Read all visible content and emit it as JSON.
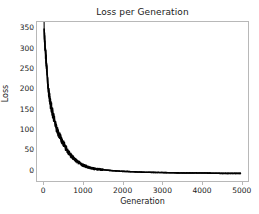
{
  "chart_data": {
    "type": "line",
    "title": "Loss per Generation",
    "xlabel": "Generation",
    "ylabel": "Loss",
    "xlim": [
      -180,
      5180
    ],
    "ylim": [
      -28,
      368
    ],
    "xticks": [
      0,
      1000,
      2000,
      3000,
      4000,
      5000
    ],
    "yticks": [
      0,
      50,
      100,
      150,
      200,
      250,
      300,
      350
    ],
    "grid": false,
    "legend": null,
    "line_color": "#000000",
    "series": [
      {
        "name": "Loss",
        "x": [
          0,
          10,
          20,
          30,
          40,
          50,
          60,
          70,
          80,
          90,
          100,
          120,
          140,
          160,
          180,
          200,
          220,
          240,
          260,
          280,
          300,
          330,
          360,
          390,
          420,
          450,
          480,
          510,
          540,
          570,
          600,
          650,
          700,
          750,
          800,
          850,
          900,
          950,
          1000,
          1100,
          1200,
          1300,
          1400,
          1500,
          1700,
          2000,
          2500,
          3000,
          3500,
          4000,
          4500,
          5000
        ],
        "values": [
          352,
          330,
          312,
          300,
          290,
          278,
          262,
          248,
          236,
          222,
          210,
          192,
          178,
          166,
          158,
          150,
          140,
          132,
          124,
          116,
          108,
          99,
          92,
          86,
          80,
          74,
          68,
          62,
          57,
          52,
          47,
          40,
          34,
          29,
          24,
          20,
          17,
          14,
          11,
          7,
          4,
          2,
          1,
          0,
          -2,
          -4,
          -6,
          -7,
          -8,
          -8,
          -9,
          -9
        ]
      }
    ],
    "noise_band": {
      "description": "dense oscillation band around the decay curve",
      "start_x": 0,
      "end_x": 1500,
      "max_amplitude": 26
    }
  }
}
